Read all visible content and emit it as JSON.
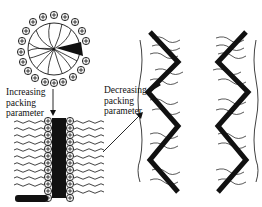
{
  "figure": {
    "type": "surfactant packing parameter phase diagram",
    "panels": [
      {
        "name": "spherical-micelle",
        "description": "spherical micelle with charged headgroups (+) and hydrocarbon tails pointing inward; one highlighted surfactant (black wedge)"
      },
      {
        "name": "bilayer",
        "description": "lamellar bilayer with headgroups (+) and wavy tails; one highlighted surfactant lying horizontal"
      },
      {
        "name": "inverted-structure",
        "description": "zig-zag inverted phase with tails pointing outward"
      }
    ],
    "labels": {
      "increasing": [
        "Increasing",
        "packing",
        "parameter"
      ],
      "decreasing": [
        "Decreasing",
        "packing",
        "parameter"
      ]
    },
    "head_symbol": "+",
    "colors": {
      "ink": "#111111",
      "background": "#ffffff"
    }
  }
}
